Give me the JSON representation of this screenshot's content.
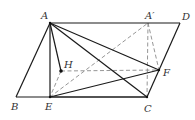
{
  "figure": {
    "points": {
      "A": {
        "label": "A",
        "x": 50,
        "y": 23,
        "lx": 41,
        "ly": 19
      },
      "Ap": {
        "label": "A′",
        "x": 148,
        "y": 23,
        "lx": 145,
        "ly": 19
      },
      "D": {
        "label": "D",
        "x": 180,
        "y": 23,
        "lx": 182,
        "ly": 20
      },
      "B": {
        "label": "B",
        "x": 16,
        "y": 97,
        "lx": 11,
        "ly": 110
      },
      "E": {
        "label": "E",
        "x": 50,
        "y": 97,
        "lx": 45,
        "ly": 110
      },
      "C": {
        "label": "C",
        "x": 147,
        "y": 97,
        "lx": 144,
        "ly": 112
      },
      "F": {
        "label": "F",
        "x": 159,
        "y": 70,
        "lx": 163,
        "ly": 76
      },
      "H": {
        "label": "H",
        "x": 61,
        "y": 71,
        "lx": 64,
        "ly": 68
      }
    },
    "solid_segments": [
      [
        "A",
        "D"
      ],
      [
        "B",
        "C"
      ],
      [
        "A",
        "B"
      ],
      [
        "D",
        "C"
      ],
      [
        "A",
        "E"
      ],
      [
        "A",
        "H"
      ],
      [
        "A",
        "F"
      ],
      [
        "A",
        "C"
      ],
      [
        "E",
        "F"
      ],
      [
        "E",
        "C"
      ]
    ],
    "dashed_segments": [
      [
        "E",
        "Ap"
      ],
      [
        "Ap",
        "C"
      ],
      [
        "Ap",
        "F"
      ],
      [
        "H",
        "F"
      ],
      [
        "H",
        "E"
      ]
    ],
    "marked_points": [
      "A",
      "H",
      "F",
      "E",
      "C"
    ]
  }
}
